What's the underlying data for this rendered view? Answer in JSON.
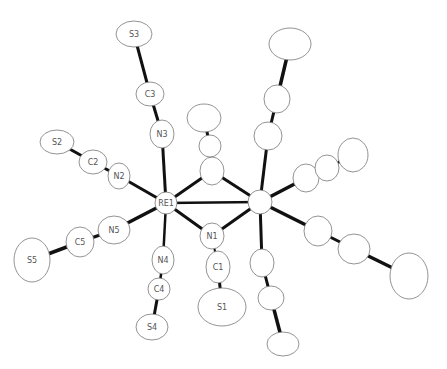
{
  "diagram": {
    "type": "ORTEP thermal ellipsoid plot",
    "atoms": [
      {
        "id": "RE1",
        "label": "RE1",
        "cx": 166,
        "cy": 203,
        "rx": 11,
        "ry": 11
      },
      {
        "id": "RE2",
        "label": "",
        "cx": 260,
        "cy": 202,
        "rx": 12,
        "ry": 12
      },
      {
        "id": "N1",
        "label": "N1",
        "cx": 212,
        "cy": 236,
        "rx": 12,
        "ry": 13
      },
      {
        "id": "C1",
        "label": "C1",
        "cx": 218,
        "cy": 267,
        "rx": 12,
        "ry": 16
      },
      {
        "id": "S1",
        "label": "S1",
        "cx": 222,
        "cy": 307,
        "rx": 24,
        "ry": 19
      },
      {
        "id": "N2",
        "label": "N2",
        "cx": 119,
        "cy": 176,
        "rx": 11,
        "ry": 13
      },
      {
        "id": "C2",
        "label": "C2",
        "cx": 93,
        "cy": 162,
        "rx": 14,
        "ry": 12
      },
      {
        "id": "S2",
        "label": "S2",
        "cx": 57,
        "cy": 142,
        "rx": 17,
        "ry": 12
      },
      {
        "id": "N3",
        "label": "N3",
        "cx": 162,
        "cy": 134,
        "rx": 12,
        "ry": 14
      },
      {
        "id": "C3",
        "label": "C3",
        "cx": 150,
        "cy": 94,
        "rx": 14,
        "ry": 12
      },
      {
        "id": "S3",
        "label": "S3",
        "cx": 134,
        "cy": 34,
        "rx": 18,
        "ry": 13
      },
      {
        "id": "N4",
        "label": "N4",
        "cx": 163,
        "cy": 260,
        "rx": 11,
        "ry": 14
      },
      {
        "id": "C4",
        "label": "C4",
        "cx": 159,
        "cy": 289,
        "rx": 11,
        "ry": 11
      },
      {
        "id": "S4",
        "label": "S4",
        "cx": 152,
        "cy": 327,
        "rx": 16,
        "ry": 13
      },
      {
        "id": "N5",
        "label": "N5",
        "cx": 114,
        "cy": 230,
        "rx": 16,
        "ry": 14
      },
      {
        "id": "C5",
        "label": "C5",
        "cx": 80,
        "cy": 242,
        "rx": 14,
        "ry": 15
      },
      {
        "id": "S5",
        "label": "S5",
        "cx": 32,
        "cy": 260,
        "rx": 18,
        "ry": 22
      },
      {
        "id": "B1",
        "label": "",
        "cx": 212,
        "cy": 171,
        "rx": 12,
        "ry": 14
      },
      {
        "id": "B2",
        "label": "",
        "cx": 210,
        "cy": 146,
        "rx": 11,
        "ry": 11
      },
      {
        "id": "B3",
        "label": "",
        "cx": 204,
        "cy": 118,
        "rx": 17,
        "ry": 14
      },
      {
        "id": "R_up_N",
        "label": "",
        "cx": 268,
        "cy": 136,
        "rx": 14,
        "ry": 14
      },
      {
        "id": "R_up_C",
        "label": "",
        "cx": 277,
        "cy": 99,
        "rx": 13,
        "ry": 14
      },
      {
        "id": "R_up_S",
        "label": "",
        "cx": 290,
        "cy": 44,
        "rx": 21,
        "ry": 16
      },
      {
        "id": "R_r_N",
        "label": "",
        "cx": 306,
        "cy": 178,
        "rx": 13,
        "ry": 14
      },
      {
        "id": "R_r_C",
        "label": "",
        "cx": 327,
        "cy": 168,
        "rx": 12,
        "ry": 13
      },
      {
        "id": "R_r_S",
        "label": "",
        "cx": 353,
        "cy": 155,
        "rx": 15,
        "ry": 17
      },
      {
        "id": "R_dr_N",
        "label": "",
        "cx": 318,
        "cy": 231,
        "rx": 14,
        "ry": 15
      },
      {
        "id": "R_dr_C",
        "label": "",
        "cx": 354,
        "cy": 249,
        "rx": 16,
        "ry": 15
      },
      {
        "id": "R_dr_S",
        "label": "",
        "cx": 409,
        "cy": 276,
        "rx": 19,
        "ry": 23
      },
      {
        "id": "R_dn_N",
        "label": "",
        "cx": 262,
        "cy": 263,
        "rx": 12,
        "ry": 14
      },
      {
        "id": "R_dn_C",
        "label": "",
        "cx": 271,
        "cy": 298,
        "rx": 13,
        "ry": 12
      },
      {
        "id": "R_dn_S",
        "label": "",
        "cx": 283,
        "cy": 344,
        "rx": 16,
        "ry": 12
      }
    ],
    "bonds": [
      [
        "RE1",
        "RE2",
        2.5
      ],
      [
        "RE1",
        "N1",
        3
      ],
      [
        "RE2",
        "N1",
        3
      ],
      [
        "RE1",
        "B1",
        3
      ],
      [
        "RE2",
        "B1",
        3
      ],
      [
        "B1",
        "B2",
        2
      ],
      [
        "B2",
        "B3",
        3
      ],
      [
        "N1",
        "C1",
        2
      ],
      [
        "C1",
        "S1",
        3
      ],
      [
        "RE1",
        "N2",
        3
      ],
      [
        "N2",
        "C2",
        3
      ],
      [
        "C2",
        "S2",
        3
      ],
      [
        "RE1",
        "N3",
        3
      ],
      [
        "N3",
        "C3",
        3
      ],
      [
        "C3",
        "S3",
        3
      ],
      [
        "RE1",
        "N4",
        2.5
      ],
      [
        "N4",
        "C4",
        2.5
      ],
      [
        "C4",
        "S4",
        3
      ],
      [
        "RE1",
        "N5",
        3.5
      ],
      [
        "N5",
        "C5",
        3
      ],
      [
        "C5",
        "S5",
        3.5
      ],
      [
        "RE2",
        "R_up_N",
        3
      ],
      [
        "R_up_N",
        "R_up_C",
        3
      ],
      [
        "R_up_C",
        "R_up_S",
        3.5
      ],
      [
        "RE2",
        "R_r_N",
        3.5
      ],
      [
        "R_r_N",
        "R_r_C",
        2
      ],
      [
        "R_r_C",
        "R_r_S",
        3
      ],
      [
        "RE2",
        "R_dr_N",
        3.5
      ],
      [
        "R_dr_N",
        "R_dr_C",
        3
      ],
      [
        "R_dr_C",
        "R_dr_S",
        3.5
      ],
      [
        "RE2",
        "R_dn_N",
        3
      ],
      [
        "R_dn_N",
        "R_dn_C",
        3
      ],
      [
        "R_dn_C",
        "R_dn_S",
        3.5
      ]
    ]
  }
}
